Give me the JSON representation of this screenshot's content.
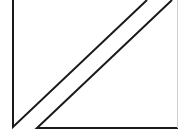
{
  "diagram": {
    "stroke_color": "#1a1a1a",
    "background": "#ffffff",
    "shapes": [
      {
        "name": "left-triangle",
        "points": "13,0 13,127 147,0"
      },
      {
        "name": "right-triangle",
        "points": "172,0 37,128 178,128"
      }
    ]
  }
}
